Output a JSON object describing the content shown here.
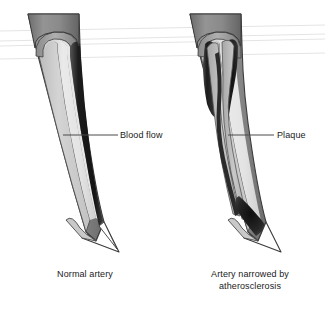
{
  "figure": {
    "background_color": "#ffffff"
  },
  "callouts": [
    {
      "id": "blood-flow",
      "label": "Blood flow",
      "points_to": "normal-artery-lumen"
    },
    {
      "id": "plaque",
      "label": "Plaque",
      "points_to": "narrowed-artery-plaque"
    }
  ],
  "panels": [
    {
      "id": "normal-artery",
      "caption_lines": [
        "Normal artery"
      ],
      "callout_label": "Blood flow"
    },
    {
      "id": "narrowed-artery",
      "caption_lines": [
        "Artery narrowed by",
        "atherosclerosis"
      ],
      "callout_label": "Plaque"
    }
  ],
  "colors": {
    "outer_wall": "#8d8d8d",
    "outer_wall_dark": "#6f6f6f",
    "inner_wall_light": "#c9c9c9",
    "lumen_wall_pale": "#d8d8d8",
    "lumen_dark": "#2a2a2a",
    "lumen_black": "#141414",
    "plaque_fill": "#b4b4b4",
    "outline": "#3b3b3b",
    "leader_line": "#4a4a4a",
    "text": "#1a1a1a",
    "scanline": "#e2e2e2"
  },
  "artifacts": {
    "scanlines_present": true,
    "scanline_count": 4
  }
}
